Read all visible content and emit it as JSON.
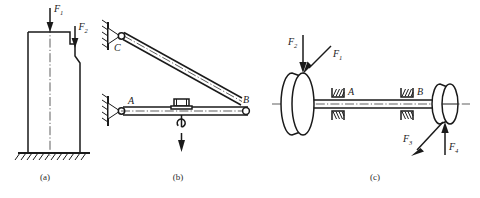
{
  "figure": {
    "background_color": "#ffffff",
    "line_color": "#1a1a1a",
    "width": 480,
    "height": 198
  },
  "panels": [
    {
      "id": "a",
      "caption": "(a)",
      "description": "stepped column on fixed ground",
      "labels": [
        {
          "name": "force-f1",
          "base": "F",
          "sub": "1",
          "direction": "down"
        },
        {
          "name": "force-f2",
          "base": "F",
          "sub": "2",
          "direction": "down"
        }
      ],
      "support": "fixed-ground-hatched",
      "centerline": true
    },
    {
      "id": "b",
      "caption": "(b)",
      "description": "wall bracket crane with hoisted load",
      "labels": [
        {
          "name": "joint-c",
          "base": "C",
          "sub": ""
        },
        {
          "name": "joint-a",
          "base": "A",
          "sub": ""
        },
        {
          "name": "joint-b",
          "base": "B",
          "sub": ""
        }
      ],
      "supports": [
        "pin-support-c",
        "pin-support-a"
      ],
      "members": [
        "diagonal-tie-cb",
        "horizontal-beam-ab"
      ],
      "load": "trolley-hook-downward-arrow"
    },
    {
      "id": "c",
      "caption": "(c)",
      "description": "shaft with two pulleys in bearings A and B",
      "labels": [
        {
          "name": "bearing-a",
          "base": "A",
          "sub": ""
        },
        {
          "name": "bearing-b",
          "base": "B",
          "sub": ""
        },
        {
          "name": "force-f1",
          "base": "F",
          "sub": "1",
          "direction": "down-left-diagonal"
        },
        {
          "name": "force-f2",
          "base": "F",
          "sub": "2",
          "direction": "down"
        },
        {
          "name": "force-f3",
          "base": "F",
          "sub": "3",
          "direction": "down-left-diagonal"
        },
        {
          "name": "force-f4",
          "base": "F",
          "sub": "4",
          "direction": "up"
        }
      ],
      "components": [
        "left-pulley",
        "right-pulley",
        "shaft",
        "bearing-a",
        "bearing-b"
      ],
      "centerline": true
    }
  ]
}
